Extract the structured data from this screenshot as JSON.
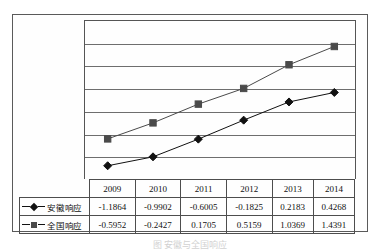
{
  "chart_data": {
    "type": "line",
    "title": "",
    "xlabel": "",
    "ylabel": "",
    "categories": [
      "2009",
      "2010",
      "2011",
      "2012",
      "2013",
      "2014"
    ],
    "ylim": [
      -1.5,
      2
    ],
    "ytick_labels": [
      "2",
      "1.5",
      "1",
      "0.5",
      "0",
      "-0.5",
      "-1",
      "-1.5"
    ],
    "ytick_values": [
      2,
      1.5,
      1,
      0.5,
      0,
      -0.5,
      -1,
      -1.5
    ],
    "grid": true,
    "legend_position": "table-left",
    "series": [
      {
        "name": "安徽响应",
        "marker": "diamond",
        "color": "#111111",
        "values": [
          -1.1864,
          -0.9902,
          -0.6005,
          -0.1825,
          0.2183,
          0.4268
        ],
        "labels": [
          "-1.1864",
          "-0.9902",
          "-0.6005",
          "-0.1825",
          "0.2183",
          "0.4268"
        ]
      },
      {
        "name": "全国响应",
        "marker": "square",
        "color": "#4a4a4a",
        "values": [
          -0.5952,
          -0.2427,
          0.1705,
          0.5159,
          1.0369,
          1.4391
        ],
        "labels": [
          "-0.5952",
          "-0.2427",
          "0.1705",
          "0.5159",
          "1.0369",
          "1.4391"
        ]
      }
    ]
  },
  "table": {
    "header_label": "",
    "columns": [
      "2009",
      "2010",
      "2011",
      "2012",
      "2013",
      "2014"
    ],
    "rows": [
      {
        "label": "安徽响应",
        "marker": "diamond-icon",
        "cells": [
          "-1.1864",
          "-0.9902",
          "-0.6005",
          "-0.1825",
          "0.2183",
          "0.4268"
        ]
      },
      {
        "label": "全国响应",
        "marker": "square-icon",
        "cells": [
          "-0.5952",
          "-0.2427",
          "0.1705",
          "0.5159",
          "1.0369",
          "1.4391"
        ]
      }
    ]
  },
  "caption": {
    "text": "图     安徽与全国响应"
  }
}
